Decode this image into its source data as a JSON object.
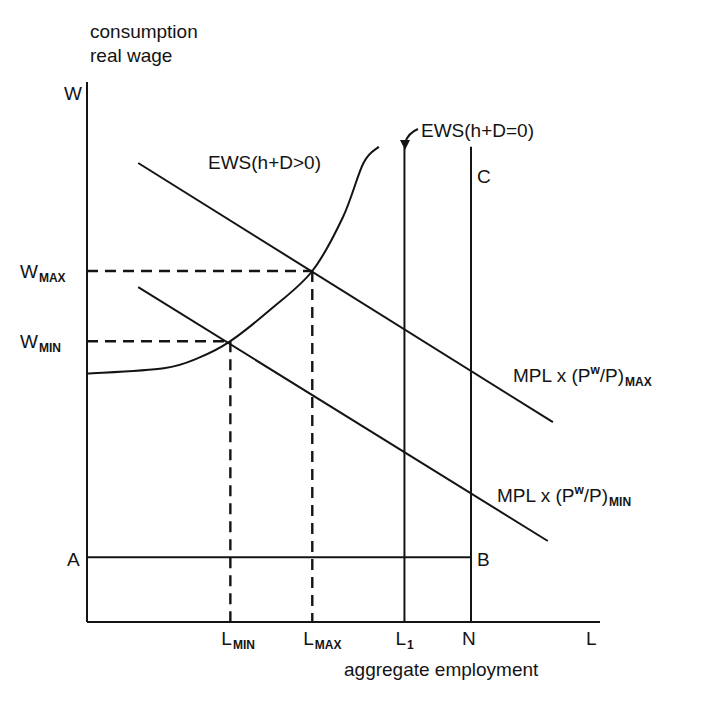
{
  "chart_data": {
    "type": "line",
    "title": "",
    "ylabel_lines": [
      "consumption",
      "real wage"
    ],
    "y_axis_symbol": "W",
    "xlabel": "aggregate employment",
    "x_axis_symbol": "L",
    "grid": false,
    "legend": "none",
    "x_ticks": [
      {
        "id": "lmin",
        "main": "L",
        "sub": "MIN",
        "value": 0.28
      },
      {
        "id": "lmax",
        "main": "L",
        "sub": "MAX",
        "value": 0.44
      },
      {
        "id": "l1",
        "main": "L",
        "sub": "1",
        "value": 0.62
      },
      {
        "id": "n",
        "main": "N",
        "sub": "",
        "value": 0.75
      }
    ],
    "y_ticks": [
      {
        "id": "wmax",
        "main": "W",
        "sub": "MAX",
        "value": 0.65
      },
      {
        "id": "wmin",
        "main": "W",
        "sub": "MIN",
        "value": 0.52
      }
    ],
    "xlim": [
      0,
      1
    ],
    "ylim": [
      0,
      1
    ],
    "series": [
      {
        "id": "mpl-max",
        "name": "MPL x (P^w/P)_MAX",
        "label_main": "MPL x (P",
        "label_sup": "w",
        "label_rest": "/P)",
        "label_sub": "MAX",
        "style": "solid",
        "points": [
          [
            0.1,
            0.85
          ],
          [
            0.91,
            0.37
          ]
        ]
      },
      {
        "id": "mpl-min",
        "name": "MPL x (P^w/P)_MIN",
        "label_main": "MPL x (P",
        "label_sup": "w",
        "label_rest": "/P)",
        "label_sub": "MIN",
        "style": "solid",
        "points": [
          [
            0.1,
            0.62
          ],
          [
            0.9,
            0.15
          ]
        ]
      },
      {
        "id": "ews-pos",
        "name": "EWS(h+D>0)",
        "label": "EWS(h+D>0)",
        "style": "curve",
        "points": [
          [
            0.0,
            0.46
          ],
          [
            0.15,
            0.47
          ],
          [
            0.22,
            0.49
          ],
          [
            0.28,
            0.52
          ],
          [
            0.36,
            0.58
          ],
          [
            0.44,
            0.65
          ],
          [
            0.5,
            0.75
          ],
          [
            0.54,
            0.85
          ],
          [
            0.57,
            0.88
          ]
        ]
      },
      {
        "id": "ews-zero",
        "name": "EWS(h+D=0)",
        "label": "EWS(h+D=0)",
        "style": "vertical",
        "x": 0.62,
        "y_top": 0.88
      },
      {
        "id": "c-line",
        "name": "C",
        "label": "C",
        "style": "vertical",
        "x": 0.75,
        "y_top": 0.88
      },
      {
        "id": "ab-line",
        "name": "AB",
        "label_start": "A",
        "label_end": "B",
        "style": "horizontal",
        "y": 0.12,
        "x_end": 0.75
      }
    ],
    "annotations": [
      {
        "type": "dashed-guide",
        "from": "wmax",
        "to": "lmax",
        "point": [
          0.44,
          0.65
        ]
      },
      {
        "type": "dashed-guide",
        "from": "wmin",
        "to": "lmin",
        "point": [
          0.28,
          0.52
        ]
      },
      {
        "type": "arrow",
        "text": "EWS(h+D=0)",
        "points_to": "ews-zero"
      }
    ]
  }
}
